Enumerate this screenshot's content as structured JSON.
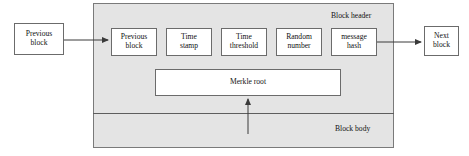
{
  "diagram": {
    "colors": {
      "block_fill": "#e4e4e4",
      "box_fill": "#ffffff",
      "stroke": "#6b6b6b",
      "text": "#111111"
    },
    "regions": {
      "header_label": "Block header",
      "body_label": "Block body"
    },
    "external_nodes": {
      "previous": {
        "line1": "Previous",
        "line2": "block"
      },
      "next": {
        "line1": "Next",
        "line2": "block"
      }
    },
    "header_fields": [
      {
        "line1": "Previous",
        "line2": "block"
      },
      {
        "line1": "Time",
        "line2": "stamp"
      },
      {
        "line1": "Time",
        "line2": "threshold"
      },
      {
        "line1": "Random",
        "line2": "number"
      },
      {
        "line1": "message",
        "line2": "hash"
      }
    ],
    "merkle_root": {
      "label": "Merkle root"
    },
    "arrows": [
      {
        "name": "prev-block-to-header",
        "from": "Previous block",
        "to": "Block header previous block"
      },
      {
        "name": "message-hash-to-next-block",
        "from": "message hash",
        "to": "Next block"
      },
      {
        "name": "block-body-to-merkle-root",
        "from": "Block body",
        "to": "Merkle root"
      }
    ]
  }
}
